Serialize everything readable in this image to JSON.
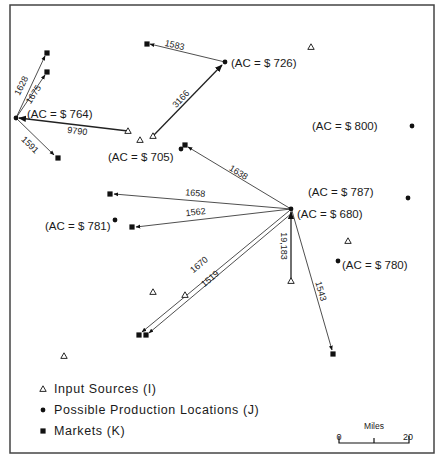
{
  "frame": {
    "x": 10,
    "y": 5,
    "w": 424,
    "h": 448,
    "stroke": "#444444"
  },
  "input_sources": [
    {
      "id": "I1",
      "x": 311,
      "y": 47
    },
    {
      "id": "I2",
      "x": 128,
      "y": 131
    },
    {
      "id": "I3",
      "x": 140,
      "y": 140
    },
    {
      "id": "I4",
      "x": 153,
      "y": 136
    },
    {
      "id": "I5",
      "x": 348,
      "y": 241
    },
    {
      "id": "I6",
      "x": 291,
      "y": 281
    },
    {
      "id": "I7",
      "x": 153,
      "y": 292
    },
    {
      "id": "I8",
      "x": 185,
      "y": 295
    },
    {
      "id": "I9",
      "x": 64,
      "y": 356
    }
  ],
  "production_locations": [
    {
      "id": "J1",
      "x": 16,
      "y": 118,
      "label": "(AC = $ 764)",
      "lx": 27,
      "ly": 118
    },
    {
      "id": "J2",
      "x": 225,
      "y": 62,
      "label": "(AC = $ 726)",
      "lx": 231,
      "ly": 67
    },
    {
      "id": "J3",
      "x": 181,
      "y": 149,
      "label": "(AC = $ 705)",
      "lx": 108,
      "ly": 161
    },
    {
      "id": "J4",
      "x": 412,
      "y": 126,
      "label": "(AC = $ 800)",
      "lx": 312,
      "ly": 130
    },
    {
      "id": "J5",
      "x": 408,
      "y": 198,
      "label": "(AC = $ 787)",
      "lx": 308,
      "ly": 196
    },
    {
      "id": "J6",
      "x": 291,
      "y": 209,
      "label": "(AC = $ 680)",
      "lx": 297,
      "ly": 218
    },
    {
      "id": "J7",
      "x": 115,
      "y": 220,
      "label": "(AC = $ 781)",
      "lx": 45,
      "ly": 230
    },
    {
      "id": "J8",
      "x": 338,
      "y": 261,
      "label": "(AC = $ 780)",
      "lx": 342,
      "ly": 269
    }
  ],
  "markets": [
    {
      "id": "K1",
      "x": 47,
      "y": 53
    },
    {
      "id": "K2",
      "x": 47,
      "y": 72
    },
    {
      "id": "K3",
      "x": 58,
      "y": 158
    },
    {
      "id": "K4",
      "x": 147,
      "y": 44
    },
    {
      "id": "K5",
      "x": 185,
      "y": 145
    },
    {
      "id": "K6",
      "x": 110,
      "y": 194
    },
    {
      "id": "K7",
      "x": 132,
      "y": 227
    },
    {
      "id": "K8",
      "x": 139,
      "y": 335
    },
    {
      "id": "K9",
      "x": 146,
      "y": 335
    },
    {
      "id": "K10",
      "x": 333,
      "y": 354
    }
  ],
  "flows": [
    {
      "from": [
        225,
        62
      ],
      "to": [
        150,
        44
      ],
      "value": "1583",
      "lx": 174,
      "ly": 48,
      "angle": 13,
      "w": 0.8
    },
    {
      "from": [
        153,
        136
      ],
      "to": [
        222,
        65
      ],
      "value": "3166",
      "lx": 183,
      "ly": 101,
      "angle": -47,
      "w": 1.3
    },
    {
      "from": [
        128,
        131
      ],
      "to": [
        19,
        118
      ],
      "value": "9790",
      "lx": 77,
      "ly": 134,
      "angle": 7,
      "w": 1.3
    },
    {
      "from": [
        16,
        118
      ],
      "to": [
        45,
        56
      ],
      "value": "1628",
      "lx": 24,
      "ly": 87,
      "angle": -64,
      "w": 0.8
    },
    {
      "from": [
        16,
        118
      ],
      "to": [
        45,
        75
      ],
      "value": "1675",
      "lx": 36,
      "ly": 96,
      "angle": -57,
      "w": 0.8
    },
    {
      "from": [
        16,
        118
      ],
      "to": [
        54,
        155
      ],
      "value": "1591",
      "lx": 28,
      "ly": 147,
      "angle": 44,
      "w": 0.8
    },
    {
      "from": [
        291,
        209
      ],
      "to": [
        188,
        147
      ],
      "value": "1638",
      "lx": 237,
      "ly": 175,
      "angle": 31,
      "w": 0.8
    },
    {
      "from": [
        291,
        209
      ],
      "to": [
        114,
        194
      ],
      "value": "1658",
      "lx": 195,
      "ly": 196,
      "angle": 5,
      "w": 0.8
    },
    {
      "from": [
        291,
        209
      ],
      "to": [
        136,
        227
      ],
      "value": "1562",
      "lx": 196,
      "ly": 215,
      "angle": -7,
      "w": 0.8
    },
    {
      "from": [
        289,
        211
      ],
      "to": [
        142,
        332
      ],
      "value": "1670",
      "lx": 201,
      "ly": 267,
      "angle": -40,
      "w": 0.8
    },
    {
      "from": [
        292,
        213
      ],
      "to": [
        149,
        333
      ],
      "value": "1519",
      "lx": 212,
      "ly": 281,
      "angle": -40,
      "w": 0.8
    },
    {
      "from": [
        291,
        281
      ],
      "to": [
        291,
        212
      ],
      "value": "19,183",
      "lx": 281,
      "ly": 246,
      "angle": 90,
      "w": 1.3
    },
    {
      "from": [
        292,
        211
      ],
      "to": [
        332,
        350
      ],
      "value": "1543",
      "lx": 318,
      "ly": 292,
      "angle": 74,
      "w": 0.8
    }
  ],
  "legend": {
    "items": [
      {
        "symbol": "triangle",
        "label": "Input Sources  (I)",
        "y": 393
      },
      {
        "symbol": "circle",
        "label": "Possible  Production  Locations  (J)",
        "y": 414
      },
      {
        "symbol": "square",
        "label": "Markets  (K)",
        "y": 435
      }
    ]
  },
  "scale_bar": {
    "title": "Miles",
    "min_label": "0",
    "max_label": "20"
  }
}
